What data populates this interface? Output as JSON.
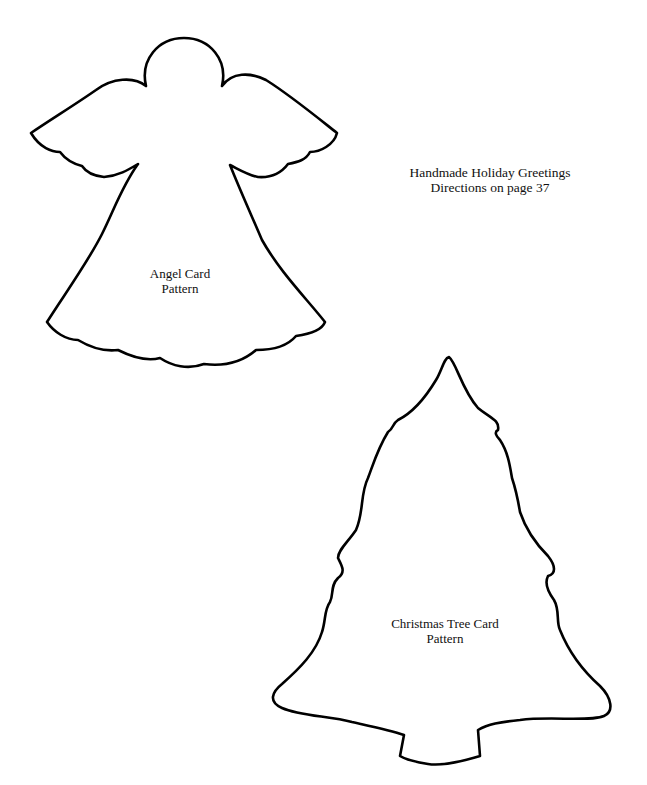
{
  "header": {
    "title": "Handmade Holiday Greetings",
    "subtitle": "Directions on page 37"
  },
  "patterns": [
    {
      "name": "angel",
      "label_line1": "Angel Card",
      "label_line2": "Pattern"
    },
    {
      "name": "christmas-tree",
      "label_line1": "Christmas Tree Card",
      "label_line2": "Pattern"
    }
  ],
  "colors": {
    "outline": "#000000",
    "background": "#ffffff",
    "text": "#111111"
  }
}
